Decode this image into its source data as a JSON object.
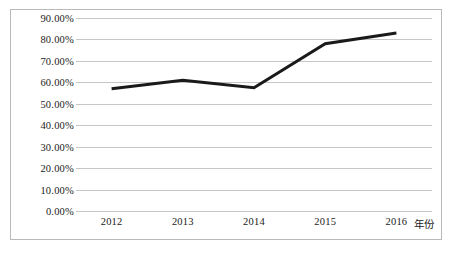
{
  "chart_data": {
    "type": "line",
    "title": "",
    "subtitle": "",
    "xlabel": "年份",
    "ylabel": "",
    "categories": [
      "2012",
      "2013",
      "2014",
      "2015",
      "2016"
    ],
    "x": [
      2012,
      2013,
      2014,
      2015,
      2016
    ],
    "series": [
      {
        "name": "",
        "values": [
          0.57,
          0.61,
          0.575,
          0.78,
          0.83
        ],
        "color": "#1a1a1a"
      }
    ],
    "values": [
      0.57,
      0.61,
      0.575,
      0.78,
      0.83
    ],
    "ylim": [
      0.0,
      0.9
    ],
    "ytick_values": [
      0.9,
      0.8,
      0.7,
      0.6,
      0.5,
      0.4,
      0.3,
      0.2,
      0.1,
      0.0
    ],
    "ytick_labels": [
      "90.00%",
      "80.00%",
      "70.00%",
      "60.00%",
      "50.00%",
      "40.00%",
      "30.00%",
      "20.00%",
      "10.00%",
      "0.00%"
    ],
    "xtick_labels": [
      "2012",
      "2013",
      "2014",
      "2015",
      "2016"
    ],
    "grid": true,
    "grid_axis": "y",
    "grid_color": "#c6c6c6",
    "legend": false,
    "legend_position": "none",
    "line_color": "#1a1a1a",
    "line_width": 3,
    "markers": false,
    "background_color": "#ffffff",
    "border_color": "#b9b9b9",
    "annotations": []
  }
}
